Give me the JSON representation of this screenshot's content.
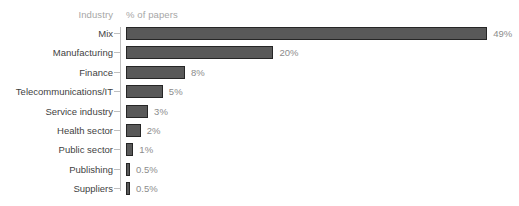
{
  "header": {
    "category_header": "Industry",
    "value_header": "% of papers"
  },
  "chart_data": {
    "type": "bar",
    "orientation": "horizontal",
    "title": "",
    "subtitle": "",
    "xlabel": "% of papers",
    "ylabel": "Industry",
    "grid": false,
    "legend": false,
    "xlim": [
      0,
      50
    ],
    "bar_color": "#595959",
    "bar_border_color": "#262626",
    "value_label_color": "#8c8c8c",
    "category_label_color": "#3f3f3f",
    "header_color": "#a6a6a6",
    "axis_color": "#bfbfbf",
    "background": "#ffffff",
    "categories": [
      "Mix",
      "Manufacturing",
      "Finance",
      "Telecommunications/IT",
      "Service industry",
      "Health sector",
      "Public sector",
      "Publishing",
      "Suppliers"
    ],
    "values": [
      49,
      20,
      8,
      5,
      3,
      2,
      1,
      0.5,
      0.5
    ],
    "value_labels": [
      "49%",
      "20%",
      "8%",
      "5%",
      "3%",
      "2%",
      "1%",
      "0.5%",
      "0.5%"
    ]
  }
}
